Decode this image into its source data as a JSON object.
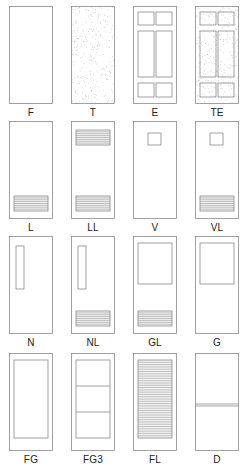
{
  "diagram": {
    "title": "",
    "line_color": "#8a8a8a",
    "louver_color": "#9a9a9a",
    "texture_color": "#b8b8b8",
    "label_color": "#222222",
    "doors": [
      {
        "code": "F",
        "type": "flush",
        "row": 0,
        "col": 0
      },
      {
        "code": "T",
        "type": "textured-flush",
        "row": 0,
        "col": 1
      },
      {
        "code": "E",
        "type": "six-panel",
        "row": 0,
        "col": 2
      },
      {
        "code": "TE",
        "type": "textured-six-panel",
        "row": 0,
        "col": 3
      },
      {
        "code": "L",
        "type": "bottom-louver",
        "row": 1,
        "col": 0
      },
      {
        "code": "LL",
        "type": "top-bottom-louver",
        "row": 1,
        "col": 1
      },
      {
        "code": "V",
        "type": "vision-lite",
        "row": 1,
        "col": 2
      },
      {
        "code": "VL",
        "type": "vision-lite-louver",
        "row": 1,
        "col": 3
      },
      {
        "code": "N",
        "type": "narrow-lite",
        "row": 2,
        "col": 0
      },
      {
        "code": "NL",
        "type": "narrow-lite-louver",
        "row": 2,
        "col": 1
      },
      {
        "code": "GL",
        "type": "half-glass-louver",
        "row": 2,
        "col": 2
      },
      {
        "code": "G",
        "type": "half-glass",
        "row": 2,
        "col": 3
      },
      {
        "code": "FG",
        "type": "full-glass",
        "row": 3,
        "col": 0
      },
      {
        "code": "FG3",
        "type": "full-glass-3-lite",
        "row": 3,
        "col": 1
      },
      {
        "code": "FL",
        "type": "full-louver",
        "row": 3,
        "col": 2
      },
      {
        "code": "D",
        "type": "dutch",
        "row": 3,
        "col": 3
      }
    ]
  }
}
